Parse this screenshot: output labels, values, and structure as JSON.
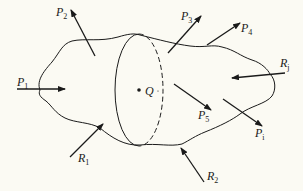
{
  "diagram": {
    "type": "free-body-section",
    "colors": {
      "background": "#fbfaf3",
      "ink": "#1a1a1a"
    },
    "point": {
      "label": "Q"
    },
    "cut_plane": {
      "shape": "ellipse",
      "style": "front solid, back dashed"
    },
    "forces": [
      {
        "id": "P1",
        "main": "P",
        "sub": "1",
        "direction": "inward"
      },
      {
        "id": "P2",
        "main": "P",
        "sub": "2",
        "direction": "outward"
      },
      {
        "id": "P3",
        "main": "P",
        "sub": "3",
        "direction": "outward"
      },
      {
        "id": "P4",
        "main": "P",
        "sub": "4",
        "direction": "outward"
      },
      {
        "id": "P5",
        "main": "P",
        "sub": "5",
        "direction": "internal"
      },
      {
        "id": "Pi",
        "main": "P",
        "sub": "i",
        "direction": "outward"
      },
      {
        "id": "Rj",
        "main": "R",
        "sub": "j",
        "direction": "inward"
      },
      {
        "id": "R1",
        "main": "R",
        "sub": "1",
        "direction": "inward"
      },
      {
        "id": "R2",
        "main": "R",
        "sub": "2",
        "direction": "inward"
      }
    ]
  }
}
